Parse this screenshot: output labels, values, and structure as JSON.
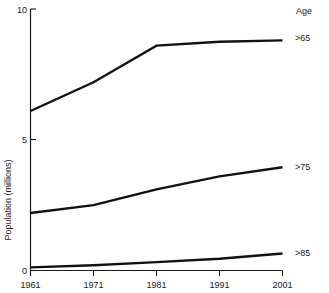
{
  "chart_data": {
    "type": "line",
    "title": "",
    "xlabel": "",
    "ylabel": "Population (millions)",
    "x": [
      1961,
      1971,
      1981,
      1991,
      2001
    ],
    "xtick_labels": [
      "1961",
      "1971",
      "1981",
      "1991",
      "2001"
    ],
    "ytick_labels": [
      "0",
      "5",
      "10"
    ],
    "ytick_values": [
      0,
      5,
      10
    ],
    "xlim": [
      1961,
      2001
    ],
    "ylim": [
      0,
      10
    ],
    "grid": false,
    "legend_position": "right",
    "legend_title": "Age",
    "series": [
      {
        "name": ">65",
        "values": [
          6.1,
          7.2,
          8.6,
          8.75,
          8.8
        ]
      },
      {
        "name": ">75",
        "values": [
          2.2,
          2.5,
          3.1,
          3.6,
          3.95
        ]
      },
      {
        "name": ">85",
        "values": [
          0.12,
          0.2,
          0.32,
          0.45,
          0.65
        ]
      }
    ]
  },
  "axes": {
    "y_axis_title": "Population (millions)",
    "y_ticks": [
      {
        "label": "10",
        "value": 10
      },
      {
        "label": "5",
        "value": 5
      },
      {
        "label": "0",
        "value": 0
      }
    ],
    "x_ticks": [
      {
        "label": "1961",
        "value": 1961
      },
      {
        "label": "1971",
        "value": 1971
      },
      {
        "label": "1981",
        "value": 1981
      },
      {
        "label": "1991",
        "value": 1991
      },
      {
        "label": "2001",
        "value": 2001
      }
    ]
  },
  "legend": {
    "title": "Age",
    "entries": [
      {
        "label": ">65"
      },
      {
        "label": ">75"
      },
      {
        "label": ">85"
      }
    ]
  },
  "colors": {
    "line": "#111111",
    "axis": "#1a1a1a",
    "text": "#1a1a1a",
    "background": "#ffffff"
  }
}
